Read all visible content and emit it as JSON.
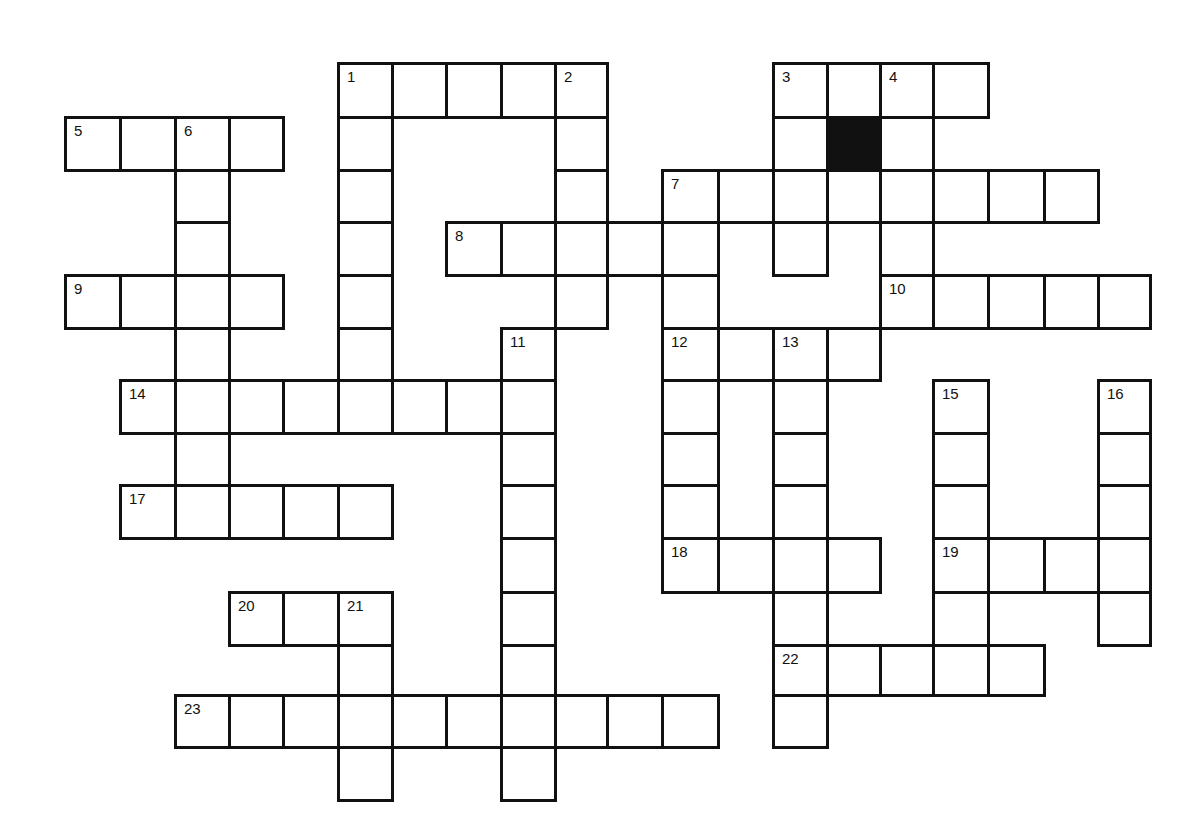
{
  "puzzle": {
    "type": "crossword",
    "colors": {
      "ink": "#111111",
      "paper": "#ffffff",
      "block": "#111111"
    },
    "grid_geometry": {
      "col_x": [
        65,
        120,
        175,
        229,
        283,
        338,
        392,
        446,
        501,
        555,
        607,
        662,
        718,
        773,
        827,
        880,
        933,
        988,
        1044,
        1098,
        1150
      ],
      "row_y": [
        63,
        117,
        170,
        222,
        275,
        328,
        380,
        433,
        485,
        538,
        592,
        645,
        695,
        747,
        800
      ]
    },
    "entries": [
      {
        "number": "1",
        "dir": "across",
        "row": 0,
        "col": 5,
        "length": 5
      },
      {
        "number": "1",
        "dir": "down",
        "row": 0,
        "col": 5,
        "length": 7
      },
      {
        "number": "2",
        "dir": "down",
        "row": 0,
        "col": 9,
        "length": 5
      },
      {
        "number": "3",
        "dir": "across",
        "row": 0,
        "col": 13,
        "length": 4
      },
      {
        "number": "3",
        "dir": "down",
        "row": 0,
        "col": 13,
        "length": 4
      },
      {
        "number": "4",
        "dir": "down",
        "row": 0,
        "col": 15,
        "length": 5
      },
      {
        "number": "5",
        "dir": "across",
        "row": 1,
        "col": 0,
        "length": 4
      },
      {
        "number": "6",
        "dir": "down",
        "row": 1,
        "col": 2,
        "length": 8
      },
      {
        "number": "7",
        "dir": "across",
        "row": 2,
        "col": 11,
        "length": 8
      },
      {
        "number": "7",
        "dir": "down",
        "row": 2,
        "col": 11,
        "length": 8
      },
      {
        "number": "8",
        "dir": "across",
        "row": 3,
        "col": 7,
        "length": 5
      },
      {
        "number": "9",
        "dir": "across",
        "row": 4,
        "col": 0,
        "length": 4
      },
      {
        "number": "10",
        "dir": "across",
        "row": 4,
        "col": 15,
        "length": 5
      },
      {
        "number": "11",
        "dir": "down",
        "row": 5,
        "col": 8,
        "length": 9
      },
      {
        "number": "12",
        "dir": "across",
        "row": 5,
        "col": 11,
        "length": 4
      },
      {
        "number": "13",
        "dir": "down",
        "row": 5,
        "col": 13,
        "length": 8
      },
      {
        "number": "14",
        "dir": "across",
        "row": 6,
        "col": 1,
        "length": 8
      },
      {
        "number": "15",
        "dir": "down",
        "row": 6,
        "col": 16,
        "length": 6
      },
      {
        "number": "16",
        "dir": "down",
        "row": 6,
        "col": 19,
        "length": 5
      },
      {
        "number": "17",
        "dir": "across",
        "row": 8,
        "col": 1,
        "length": 5
      },
      {
        "number": "18",
        "dir": "across",
        "row": 9,
        "col": 11,
        "length": 4
      },
      {
        "number": "19",
        "dir": "across",
        "row": 9,
        "col": 16,
        "length": 4
      },
      {
        "number": "20",
        "dir": "across",
        "row": 10,
        "col": 3,
        "length": 3
      },
      {
        "number": "21",
        "dir": "down",
        "row": 10,
        "col": 5,
        "length": 4
      },
      {
        "number": "22",
        "dir": "across",
        "row": 11,
        "col": 13,
        "length": 5
      },
      {
        "number": "22",
        "dir": "down",
        "row": 11,
        "col": 13,
        "length": 2
      },
      {
        "number": "23",
        "dir": "across",
        "row": 12,
        "col": 2,
        "length": 10
      }
    ],
    "blocks": [
      {
        "row": 1,
        "col": 14
      }
    ]
  }
}
